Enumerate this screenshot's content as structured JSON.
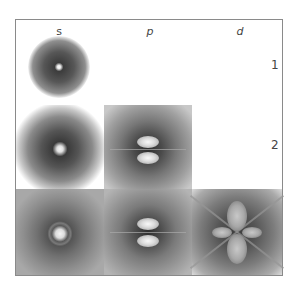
{
  "diagram": {
    "type": "atomic-orbital-density-grid",
    "columns": [
      {
        "label": "s"
      },
      {
        "label": "p"
      },
      {
        "label": "d"
      }
    ],
    "rows": [
      {
        "label": "1"
      },
      {
        "label": "2"
      },
      {
        "label": "3"
      }
    ],
    "cells": [
      {
        "row": "1",
        "col": "s",
        "orbital": "1s"
      },
      {
        "row": "2",
        "col": "s",
        "orbital": "2s"
      },
      {
        "row": "2",
        "col": "p",
        "orbital": "2p"
      },
      {
        "row": "3",
        "col": "s",
        "orbital": "3s"
      },
      {
        "row": "3",
        "col": "p",
        "orbital": "3p"
      },
      {
        "row": "3",
        "col": "d",
        "orbital": "3d"
      }
    ]
  }
}
